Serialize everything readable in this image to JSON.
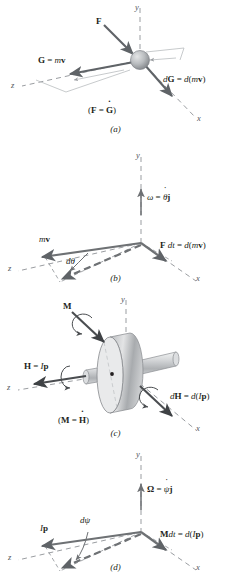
{
  "figure": {
    "colors": {
      "ink": "#231f20",
      "axis": "#9a9da1",
      "vector": "#5f6367",
      "sphere_light": "#d9dadb",
      "sphere_dark": "#8d9094",
      "disk_face": "#e7e8e9",
      "disk_rim": "#b4b7ba",
      "shaft": "#cfd1d3"
    }
  },
  "panels": [
    {
      "id": "a",
      "caption": "(a)",
      "axes": {
        "x": "x",
        "y": "y",
        "z": "z"
      },
      "labels": {
        "force": "F",
        "momentum": "G = mv",
        "differential": "dG = d(mv)",
        "relation": "(F = Ġ)"
      }
    },
    {
      "id": "b",
      "caption": "(b)",
      "axes": {
        "x": "x",
        "y": "y",
        "z": "z"
      },
      "labels": {
        "angular_velocity": "ω = θ̇j",
        "momentum": "mv",
        "angle_increment": "dθ",
        "impulse": "F dt = d(mv)"
      }
    },
    {
      "id": "c",
      "caption": "(c)",
      "axes": {
        "x": "x",
        "y": "y",
        "z": "z"
      },
      "labels": {
        "moment": "M",
        "angular_momentum": "H = Ip",
        "differential": "dH = d(Ip)",
        "relation": "(M = Ḣ)"
      }
    },
    {
      "id": "d",
      "caption": "(d)",
      "axes": {
        "x": "x",
        "y": "y",
        "z": "z"
      },
      "labels": {
        "precession": "Ω = ψ̇j",
        "angular_momentum": "Ip",
        "angle_increment": "dψ",
        "angular_impulse": "M dt = d(Ip)"
      }
    }
  ]
}
